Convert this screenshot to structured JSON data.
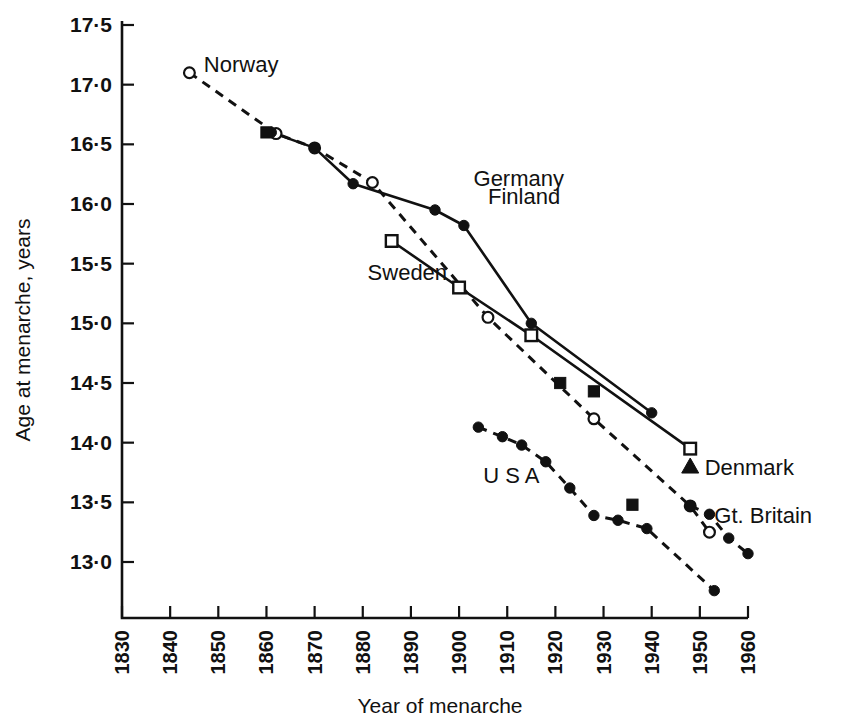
{
  "chart_data": {
    "type": "line",
    "title": "",
    "xlabel": "Year of menarche",
    "ylabel": "Age at menarche, years",
    "xlim": [
      1830,
      1960
    ],
    "ylim": [
      12.72,
      17.5
    ],
    "grid": false,
    "legend": "inline-labels",
    "xticks": [
      "1830",
      "1840",
      "1850",
      "1860",
      "1870",
      "1880",
      "1890",
      "1900",
      "1910",
      "1920",
      "1930",
      "1940",
      "1950",
      "1960"
    ],
    "yticks": [
      "13·0",
      "13·5",
      "14·0",
      "14·5",
      "15·0",
      "15·5",
      "16·0",
      "16·5",
      "17·0",
      "17·5"
    ],
    "ytick_values": [
      13.0,
      13.5,
      14.0,
      14.5,
      15.0,
      15.5,
      16.0,
      16.5,
      17.0,
      17.5
    ],
    "xtick_values": [
      1830,
      1840,
      1850,
      1860,
      1870,
      1880,
      1890,
      1900,
      1910,
      1920,
      1930,
      1940,
      1950,
      1960
    ],
    "series": [
      {
        "name": "Norway",
        "marker": "open-circle",
        "line": "dashed",
        "label_x": 1847,
        "label_y": 17.17,
        "points": [
          {
            "x": 1844,
            "y": 17.1
          },
          {
            "x": 1862,
            "y": 16.59
          },
          {
            "x": 1870,
            "y": 16.47
          },
          {
            "x": 1882,
            "y": 16.18
          },
          {
            "x": 1906,
            "y": 15.05
          },
          {
            "x": 1928,
            "y": 14.2
          },
          {
            "x": 1948,
            "y": 13.47
          },
          {
            "x": 1952,
            "y": 13.25
          }
        ]
      },
      {
        "name": "Finland",
        "marker": "filled-circle",
        "line": "solid",
        "label_x": 1908,
        "label_y": 16.08,
        "points": [
          {
            "x": 1861,
            "y": 16.6
          },
          {
            "x": 1870,
            "y": 16.47
          },
          {
            "x": 1878,
            "y": 16.17
          },
          {
            "x": 1895,
            "y": 15.95
          },
          {
            "x": 1901,
            "y": 15.82
          },
          {
            "x": 1915,
            "y": 15.0
          },
          {
            "x": 1940,
            "y": 14.25
          }
        ]
      },
      {
        "name": "Sweden",
        "marker": "open-square",
        "line": "solid",
        "label_x": 1884,
        "label_y": 15.44,
        "points": [
          {
            "x": 1886,
            "y": 15.69
          },
          {
            "x": 1900,
            "y": 15.3
          },
          {
            "x": 1915,
            "y": 14.9
          },
          {
            "x": 1948,
            "y": 13.95
          }
        ]
      },
      {
        "name": "Germany",
        "marker": "filled-square",
        "line": "none",
        "label_x": 1903,
        "label_y": 16.22,
        "points": [
          {
            "x": 1860,
            "y": 16.6
          },
          {
            "x": 1921,
            "y": 14.5
          },
          {
            "x": 1928,
            "y": 14.43
          },
          {
            "x": 1936,
            "y": 13.48
          }
        ]
      },
      {
        "name": "USA",
        "marker": "filled-circle",
        "line": "dashed",
        "label_x": 1907,
        "label_y": 13.74,
        "points": [
          {
            "x": 1904,
            "y": 14.13
          },
          {
            "x": 1909,
            "y": 14.05
          },
          {
            "x": 1913,
            "y": 13.98
          },
          {
            "x": 1918,
            "y": 13.84
          },
          {
            "x": 1923,
            "y": 13.62
          },
          {
            "x": 1928,
            "y": 13.39
          },
          {
            "x": 1933,
            "y": 13.35
          },
          {
            "x": 1939,
            "y": 13.28
          },
          {
            "x": 1953,
            "y": 12.76
          }
        ]
      },
      {
        "name": "Denmark",
        "marker": "filled-triangle",
        "line": "none",
        "label_x": 1951,
        "label_y": 13.8,
        "points": [
          {
            "x": 1948,
            "y": 13.8
          }
        ]
      },
      {
        "name": "Gt. Britain",
        "marker": "filled-circle",
        "line": "dashed",
        "label_x": 1953,
        "label_y": 13.4,
        "points": [
          {
            "x": 1948,
            "y": 13.47
          },
          {
            "x": 1952,
            "y": 13.4
          },
          {
            "x": 1956,
            "y": 13.2
          },
          {
            "x": 1960,
            "y": 13.07
          }
        ]
      }
    ],
    "series_labels": [
      {
        "name": "Norway",
        "text": "Norway",
        "x": 1847,
        "y": 17.17
      },
      {
        "name": "Germany",
        "text": "Germany",
        "x": 1903,
        "y": 16.22
      },
      {
        "name": "Finland",
        "text": "Finland",
        "x": 1906,
        "y": 16.07
      },
      {
        "name": "Sweden",
        "text": "Sweden",
        "x": 1881,
        "y": 15.43
      },
      {
        "name": "USA",
        "text": "U S A",
        "x": 1905,
        "y": 13.73
      },
      {
        "name": "Denmark",
        "text": "Denmark",
        "x": 1951,
        "y": 13.8
      },
      {
        "name": "Gt. Britain",
        "text": "Gt. Britain",
        "x": 1953,
        "y": 13.39
      }
    ]
  }
}
